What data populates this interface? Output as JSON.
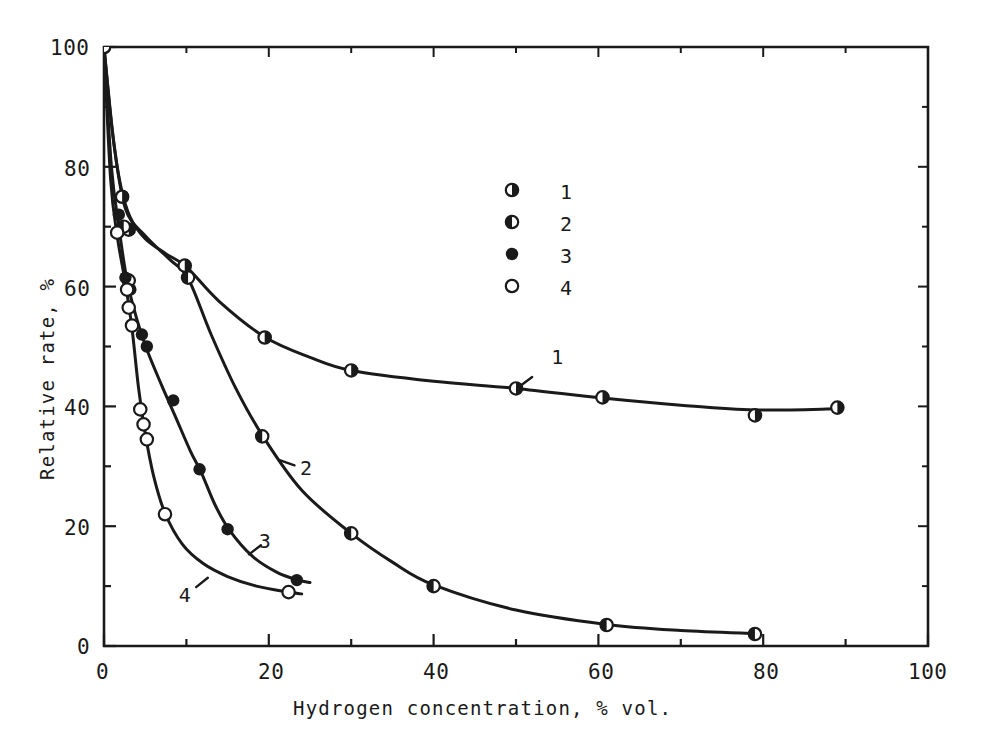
{
  "figure": {
    "kind": "scientific-line-chart",
    "background": "#ffffff",
    "ink": "#1a1a1a"
  },
  "axes": {
    "x_title": "Hydrogen concentration, % vol.",
    "y_title": "Relative rate, %",
    "x_ticks": [
      "0",
      "20",
      "40",
      "60",
      "80",
      "100"
    ],
    "y_ticks": [
      "0",
      "20",
      "40",
      "60",
      "80",
      "100"
    ]
  },
  "legend": {
    "entries": [
      {
        "label": "1",
        "marker": "half-filled-right-circle"
      },
      {
        "label": "2",
        "marker": "half-filled-left-circle"
      },
      {
        "label": "3",
        "marker": "filled-circle"
      },
      {
        "label": "4",
        "marker": "open-circle"
      }
    ]
  },
  "curve_labels": [
    {
      "label": "1"
    },
    {
      "label": "2"
    },
    {
      "label": "3"
    },
    {
      "label": "4"
    }
  ],
  "chart_data": {
    "type": "line",
    "title": "",
    "xlabel": "Hydrogen concentration, % vol.",
    "ylabel": "Relative rate, %",
    "xlim": [
      0,
      100
    ],
    "ylim": [
      0,
      100
    ],
    "xticks": [
      0,
      20,
      40,
      60,
      80,
      100
    ],
    "yticks": [
      0,
      20,
      40,
      60,
      80,
      100
    ],
    "minor_tick_step": 10,
    "grid": false,
    "legend_position": "upper-center",
    "series": [
      {
        "name": "1",
        "marker": "half-filled-right-circle",
        "points": [
          {
            "x": 0.0,
            "y": 100.0
          },
          {
            "x": 2.2,
            "y": 75.0
          },
          {
            "x": 3.0,
            "y": 69.5
          },
          {
            "x": 9.8,
            "y": 63.5
          },
          {
            "x": 19.5,
            "y": 51.5
          },
          {
            "x": 30.0,
            "y": 46.0
          },
          {
            "x": 50.0,
            "y": 43.0
          },
          {
            "x": 60.5,
            "y": 41.5
          },
          {
            "x": 79.0,
            "y": 38.5
          },
          {
            "x": 89.0,
            "y": 39.8
          }
        ],
        "curve": [
          {
            "x": 0.0,
            "y": 100.0
          },
          {
            "x": 1.0,
            "y": 86.0
          },
          {
            "x": 2.0,
            "y": 77.0
          },
          {
            "x": 3.2,
            "y": 71.5
          },
          {
            "x": 5.0,
            "y": 68.0
          },
          {
            "x": 7.5,
            "y": 65.5
          },
          {
            "x": 10.0,
            "y": 63.3
          },
          {
            "x": 14.0,
            "y": 57.5
          },
          {
            "x": 19.5,
            "y": 51.6
          },
          {
            "x": 25.0,
            "y": 48.2
          },
          {
            "x": 30.0,
            "y": 46.0
          },
          {
            "x": 40.0,
            "y": 44.2
          },
          {
            "x": 50.0,
            "y": 43.0
          },
          {
            "x": 60.5,
            "y": 41.4
          },
          {
            "x": 70.0,
            "y": 40.2
          },
          {
            "x": 79.0,
            "y": 39.4
          },
          {
            "x": 89.0,
            "y": 39.6
          }
        ]
      },
      {
        "name": "2",
        "marker": "half-filled-left-circle",
        "points": [
          {
            "x": 0.0,
            "y": 100.0
          },
          {
            "x": 2.4,
            "y": 70.0
          },
          {
            "x": 3.0,
            "y": 61.0
          },
          {
            "x": 10.2,
            "y": 61.5
          },
          {
            "x": 19.2,
            "y": 35.0
          },
          {
            "x": 30.0,
            "y": 18.8
          },
          {
            "x": 40.0,
            "y": 10.0
          },
          {
            "x": 61.0,
            "y": 3.5
          },
          {
            "x": 79.0,
            "y": 2.0
          }
        ],
        "curve": [
          {
            "x": 0.0,
            "y": 100.0
          },
          {
            "x": 1.2,
            "y": 84.0
          },
          {
            "x": 2.6,
            "y": 73.0
          },
          {
            "x": 5.0,
            "y": 68.5
          },
          {
            "x": 8.0,
            "y": 64.5
          },
          {
            "x": 10.2,
            "y": 61.4
          },
          {
            "x": 13.0,
            "y": 52.0
          },
          {
            "x": 16.0,
            "y": 43.0
          },
          {
            "x": 19.2,
            "y": 35.2
          },
          {
            "x": 24.0,
            "y": 26.0
          },
          {
            "x": 30.0,
            "y": 18.8
          },
          {
            "x": 35.0,
            "y": 14.0
          },
          {
            "x": 40.0,
            "y": 10.2
          },
          {
            "x": 50.0,
            "y": 6.0
          },
          {
            "x": 61.0,
            "y": 3.6
          },
          {
            "x": 70.0,
            "y": 2.6
          },
          {
            "x": 79.0,
            "y": 2.1
          }
        ]
      },
      {
        "name": "3",
        "marker": "filled-circle",
        "points": [
          {
            "x": 1.8,
            "y": 72.0
          },
          {
            "x": 2.6,
            "y": 61.5
          },
          {
            "x": 3.2,
            "y": 59.5
          },
          {
            "x": 4.6,
            "y": 52.0
          },
          {
            "x": 5.2,
            "y": 50.0
          },
          {
            "x": 8.4,
            "y": 41.0
          },
          {
            "x": 11.6,
            "y": 29.5
          },
          {
            "x": 15.0,
            "y": 19.5
          },
          {
            "x": 23.4,
            "y": 11.0
          }
        ],
        "curve": [
          {
            "x": 0.0,
            "y": 100.0
          },
          {
            "x": 0.9,
            "y": 80.0
          },
          {
            "x": 1.8,
            "y": 70.0
          },
          {
            "x": 2.8,
            "y": 61.0
          },
          {
            "x": 4.0,
            "y": 54.5
          },
          {
            "x": 5.2,
            "y": 49.5
          },
          {
            "x": 7.0,
            "y": 43.5
          },
          {
            "x": 8.6,
            "y": 38.5
          },
          {
            "x": 10.5,
            "y": 32.5
          },
          {
            "x": 11.8,
            "y": 29.0
          },
          {
            "x": 13.5,
            "y": 23.5
          },
          {
            "x": 15.2,
            "y": 19.4
          },
          {
            "x": 18.0,
            "y": 15.0
          },
          {
            "x": 21.0,
            "y": 12.3
          },
          {
            "x": 23.6,
            "y": 11.0
          },
          {
            "x": 25.0,
            "y": 10.6
          }
        ]
      },
      {
        "name": "4",
        "marker": "open-circle",
        "points": [
          {
            "x": 1.6,
            "y": 69.0
          },
          {
            "x": 2.8,
            "y": 59.5
          },
          {
            "x": 3.0,
            "y": 56.5
          },
          {
            "x": 3.4,
            "y": 53.5
          },
          {
            "x": 4.4,
            "y": 39.5
          },
          {
            "x": 4.8,
            "y": 37.0
          },
          {
            "x": 5.2,
            "y": 34.5
          },
          {
            "x": 7.4,
            "y": 22.0
          },
          {
            "x": 22.4,
            "y": 9.0
          }
        ],
        "curve": [
          {
            "x": 0.0,
            "y": 100.0
          },
          {
            "x": 0.8,
            "y": 78.0
          },
          {
            "x": 1.6,
            "y": 68.5
          },
          {
            "x": 2.6,
            "y": 60.5
          },
          {
            "x": 3.4,
            "y": 53.0
          },
          {
            "x": 4.2,
            "y": 43.0
          },
          {
            "x": 5.0,
            "y": 35.5
          },
          {
            "x": 6.0,
            "y": 28.5
          },
          {
            "x": 7.4,
            "y": 22.2
          },
          {
            "x": 9.5,
            "y": 17.0
          },
          {
            "x": 12.0,
            "y": 13.8
          },
          {
            "x": 15.0,
            "y": 11.6
          },
          {
            "x": 18.5,
            "y": 10.0
          },
          {
            "x": 22.4,
            "y": 9.0
          },
          {
            "x": 24.0,
            "y": 8.7
          }
        ]
      }
    ],
    "annotations": [
      {
        "text": "1",
        "x": 55.0,
        "y": 48.0,
        "leader_to": {
          "x": 50.5,
          "y": 43.4
        }
      },
      {
        "text": "2",
        "x": 24.5,
        "y": 29.5,
        "leader_to": {
          "x": 21.4,
          "y": 31.0
        }
      },
      {
        "text": "3",
        "x": 19.5,
        "y": 17.3,
        "leader_to": {
          "x": 17.6,
          "y": 15.3
        }
      },
      {
        "text": "4",
        "x": 9.8,
        "y": 8.3,
        "leader_to": {
          "x": 12.6,
          "y": 11.4
        }
      }
    ]
  }
}
